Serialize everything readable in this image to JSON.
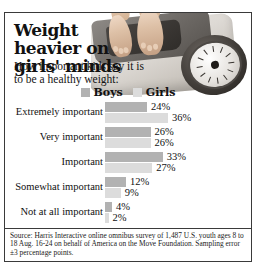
{
  "headline": "Weight heavier on girls' minds",
  "subhead": "How important kids say it is to be a healthy weight:",
  "legend": {
    "boys_label": "Boys",
    "girls_label": "Girls",
    "boys_color": "#b2b2b2",
    "girls_color": "#dcdcdc"
  },
  "source": "Source: Harris Interactive online omnibus survey of 1,487 U.S. youth ages 8 to 18 Aug. 16-24 on behalf of America on the Move Foundation. Sampling error ±3 percentage points.",
  "photo": {
    "alt": "bare feet standing on a bathroom scale with round dial"
  },
  "chart_data": {
    "type": "bar",
    "orientation": "horizontal",
    "title": "Weight heavier on girls' minds",
    "subtitle": "How important kids say it is to be a healthy weight:",
    "categories": [
      "Extremely important",
      "Very important",
      "Important",
      "Somewhat important",
      "Not at all important"
    ],
    "series": [
      {
        "name": "Boys",
        "color": "#b2b2b2",
        "values": [
          24,
          26,
          33,
          12,
          4
        ]
      },
      {
        "name": "Girls",
        "color": "#dcdcdc",
        "values": [
          36,
          26,
          27,
          9,
          2
        ]
      }
    ],
    "value_labels": [
      [
        "24%",
        "36%"
      ],
      [
        "26%",
        "26%"
      ],
      [
        "33%",
        "27%"
      ],
      [
        "12%",
        "9%"
      ],
      [
        "4%",
        "2%"
      ]
    ],
    "unit": "%",
    "xlabel": "",
    "ylabel": "",
    "xlim": [
      0,
      40
    ],
    "grid": false,
    "legend_position": "top-center",
    "note": "Source: Harris Interactive online omnibus survey of 1,487 U.S. youth ages 8 to 18 Aug. 16-24 on behalf of America on the Move Foundation. Sampling error ±3 percentage points."
  }
}
